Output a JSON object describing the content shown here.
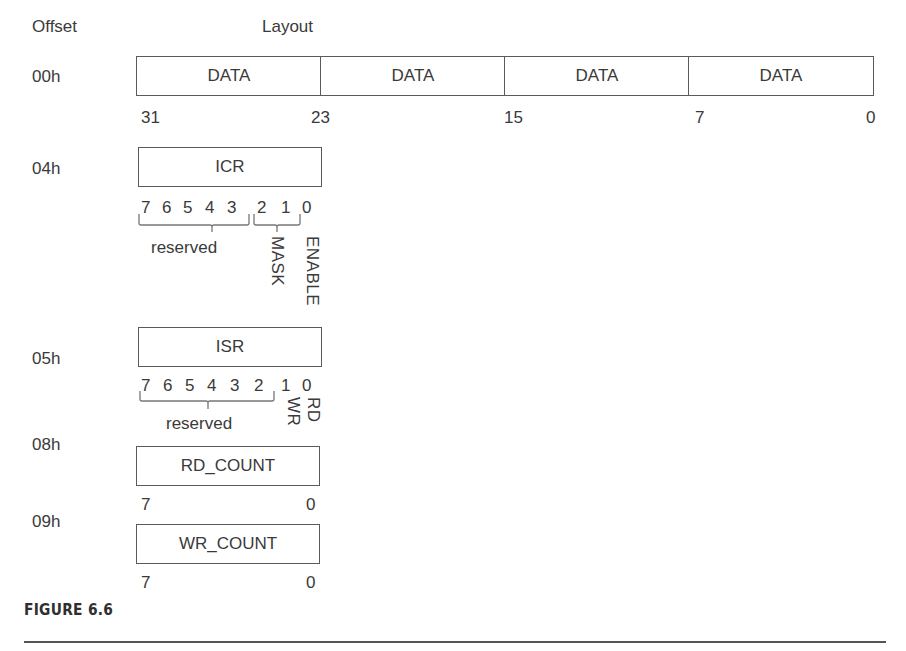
{
  "headers": {
    "offset": "Offset",
    "layout": "Layout"
  },
  "registers": {
    "data": {
      "offset": "00h",
      "fields": [
        "DATA",
        "DATA",
        "DATA",
        "DATA"
      ],
      "bit_labels": [
        "31",
        "23",
        "15",
        "7",
        "0"
      ]
    },
    "icr": {
      "offset": "04h",
      "name": "ICR",
      "bits": [
        "7",
        "6",
        "5",
        "4",
        "3",
        "2",
        "1",
        "0"
      ],
      "groups": {
        "reserved": "reserved",
        "mask": "MASK",
        "enable": "ENABLE"
      }
    },
    "isr": {
      "offset": "05h",
      "name": "ISR",
      "bits": [
        "7",
        "6",
        "5",
        "4",
        "3",
        "2",
        "1",
        "0"
      ],
      "groups": {
        "reserved": "reserved",
        "wr": "WR",
        "rd": "RD"
      }
    },
    "rd_count": {
      "offset": "08h",
      "name": "RD_COUNT",
      "msb": "7",
      "lsb": "0"
    },
    "wr_count": {
      "offset": "09h",
      "name": "WR_COUNT",
      "msb": "7",
      "lsb": "0"
    }
  },
  "caption": "FIGURE 6.6"
}
